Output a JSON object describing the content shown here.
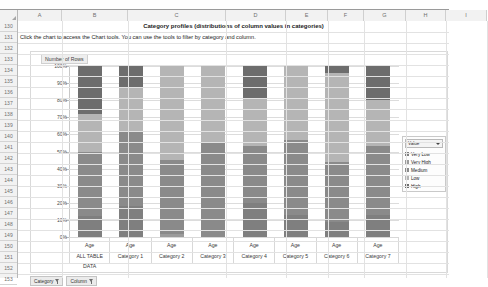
{
  "sheet": {
    "column_headers": [
      "A",
      "B",
      "C",
      "D",
      "E",
      "F",
      "G",
      "H",
      "I"
    ],
    "row_headers": [
      "130",
      "131",
      "132",
      "133",
      "134",
      "135",
      "136",
      "137",
      "138",
      "139",
      "120",
      "121",
      "122",
      "123",
      "124",
      "125",
      "126",
      "127",
      "128",
      "129",
      "130b",
      "131b",
      "132b",
      "133b"
    ],
    "row_numbers": [
      "130",
      "131",
      "132",
      "133",
      "134",
      "135",
      "136",
      "137",
      "138",
      "139",
      "140",
      "141",
      "142",
      "143",
      "144",
      "145",
      "146",
      "147",
      "148",
      "149",
      "150",
      "151",
      "152",
      "153"
    ],
    "title_cell": "Category profiles (distributions of column values in categories)",
    "help_cell": "Click the chart to access the Chart tools. You can use the tools to filter by category and column."
  },
  "chart": {
    "title": "Number of Rows",
    "legend_header": "Value",
    "slicers": [
      {
        "label": "Category",
        "icon": "filter-icon"
      },
      {
        "label": "Column",
        "icon": "filter-icon"
      }
    ]
  },
  "chart_data": {
    "type": "bar",
    "stacked": true,
    "title": "Number of Rows",
    "xlabel": "",
    "ylabel": "",
    "ylim": [
      0,
      100
    ],
    "ytick_labels": [
      "100%",
      "90%",
      "80%",
      "70%",
      "60%",
      "50%",
      "40%",
      "30%",
      "20%",
      "10%",
      "0%"
    ],
    "ytick_values": [
      100,
      90,
      80,
      70,
      60,
      50,
      40,
      30,
      20,
      10,
      0
    ],
    "grid": true,
    "legend_position": "right",
    "legend_title": "Value",
    "categories": [
      "ALL TABLE DATA",
      "Category 1",
      "Category 2",
      "Category 3",
      "Category 4",
      "Category 5",
      "Category 6",
      "Category 7"
    ],
    "category_top_label": "Age",
    "series": [
      {
        "name": "Very Low",
        "color": "#7f7f7f",
        "values": [
          12,
          18,
          0,
          0,
          20,
          13,
          9,
          13
        ]
      },
      {
        "name": "Very High",
        "color": "#9b9b9b",
        "values": [
          0,
          0,
          2,
          0,
          0,
          0,
          0,
          0
        ]
      },
      {
        "name": "Medium",
        "color": "#8a8a8a",
        "values": [
          38,
          44,
          43,
          55,
          33,
          44,
          35,
          40
        ]
      },
      {
        "name": "Low",
        "color": "#b5b5b5",
        "values": [
          22,
          26,
          55,
          45,
          28,
          43,
          52,
          27
        ]
      },
      {
        "name": "High",
        "color": "#6d6d6d",
        "values": [
          28,
          12,
          0,
          0,
          19,
          0,
          4,
          20
        ]
      }
    ],
    "legend_entries": [
      "Very Low",
      "Very High",
      "Medium",
      "Low",
      "High"
    ]
  }
}
